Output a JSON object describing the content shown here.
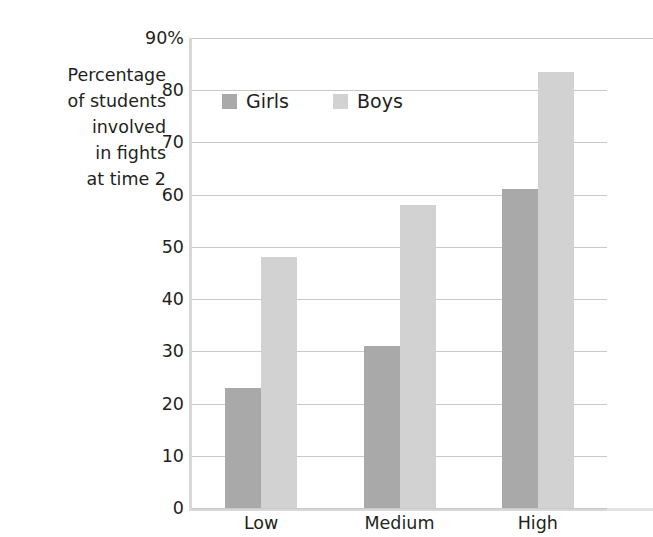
{
  "chart_data": {
    "type": "bar",
    "title": "",
    "xlabel": "",
    "ylabel": "Percentage of students involved in fights at time 2",
    "ylabel_lines": [
      "Percentage",
      "of students",
      "involved",
      "in fights",
      "at time 2"
    ],
    "categories": [
      "Low",
      "Medium",
      "High"
    ],
    "series": [
      {
        "name": "Girls",
        "values": [
          23,
          31,
          61
        ],
        "color": "#a9a9a9"
      },
      {
        "name": "Boys",
        "values": [
          48,
          58,
          83.5
        ],
        "color": "#d2d2d2"
      }
    ],
    "ylim": [
      0,
      90
    ],
    "ytick_values": [
      0,
      10,
      20,
      30,
      40,
      50,
      60,
      70,
      80,
      90
    ],
    "ytick_labels": [
      "0",
      "10",
      "20",
      "30",
      "40",
      "50",
      "60",
      "70",
      "80",
      "90%"
    ],
    "grid": true,
    "legend_position": "upper-left-inside",
    "gridline_color": "#c9c9c9",
    "axis_color": "#d8d8d8",
    "text_color": "#231f20"
  },
  "legend": {
    "items": [
      {
        "label": "Girls"
      },
      {
        "label": "Boys"
      }
    ]
  }
}
